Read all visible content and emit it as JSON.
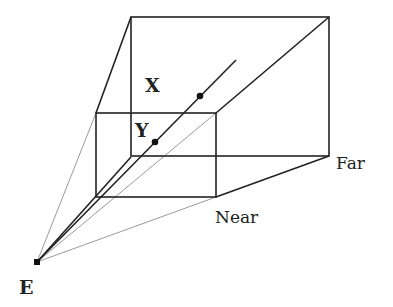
{
  "diagram": {
    "type": "perspective view frustum",
    "colors": {
      "line": "#222222",
      "guide": "#9a9a9a",
      "background": "#ffffff"
    },
    "eye": {
      "label": "E",
      "x": 37,
      "y": 262
    },
    "near_plane": {
      "label": "Near",
      "x1": 96,
      "y1": 113,
      "x2": 216,
      "y2": 197
    },
    "far_plane": {
      "label": "Far",
      "x1": 131,
      "y1": 17,
      "x2": 329,
      "y2": 156
    },
    "points": [
      {
        "label": "X",
        "x": 200,
        "y": 96
      },
      {
        "label": "Y",
        "x": 155,
        "y": 142
      }
    ],
    "ray_end": {
      "x": 236,
      "y": 60
    }
  }
}
